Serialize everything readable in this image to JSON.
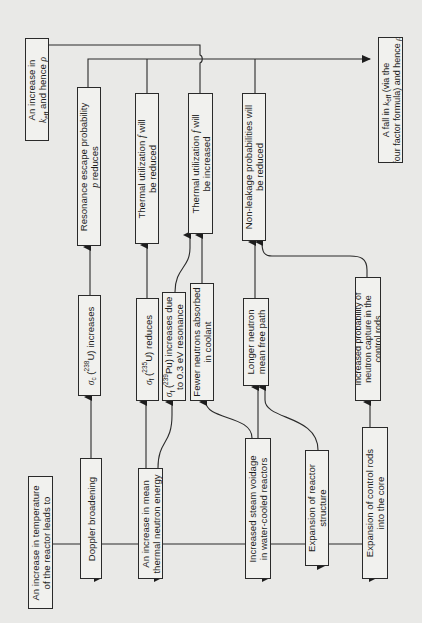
{
  "figure": {
    "orientation": "rotated-90-ccw",
    "line_color": "#2a2a2a",
    "box_fill": "#f1f1ee",
    "page_bg": "#e9e9e7"
  },
  "boxes": {
    "temperature_increase": {
      "lines": [
        "An increase in temperature",
        "of the reactor leads to"
      ]
    },
    "doppler": {
      "lines": [
        "Doppler broadening"
      ]
    },
    "thermal_energy": {
      "lines": [
        "An increase in mean",
        "thermal neutron energy"
      ]
    },
    "steam_voidage": {
      "lines": [
        "Increased steam voidage",
        "in water-cooled reactors"
      ]
    },
    "structure_expansion": {
      "lines": [
        "Expansion of reactor",
        "structure"
      ]
    },
    "control_rods_expansion": {
      "lines": [
        "Expansion of control rods",
        "into the core"
      ]
    },
    "sigma_c_u238": {
      "prefix": "σ",
      "prefix_sub": "c",
      "iso_sup": "238",
      "element": "U",
      "suffix": ") increases",
      "open": " ("
    },
    "sigma_f_u235": {
      "prefix": "σ",
      "prefix_sub": "f",
      "iso_sup": "235",
      "element": "U",
      "suffix": ") reduces",
      "open": " ("
    },
    "sigma_f_pu239": {
      "prefix": "σ",
      "prefix_sub": "f",
      "iso_sup": "239",
      "element": "Pu",
      "suffix": ") increases due",
      "open": " (",
      "line2": "to 0.3 eV resonance"
    },
    "fewer_absorbed": {
      "lines": [
        "Fewer neutrons absorbed",
        "in coolant"
      ]
    },
    "longer_mfp": {
      "lines": [
        "Longer neutron",
        "mean free path"
      ]
    },
    "control_rod_capture": {
      "lines": [
        "Increased probability of",
        "neutron capture in the",
        "control rods"
      ]
    },
    "resonance_escape": {
      "line1": "Resonance escape probability",
      "symbol": "p",
      "line2_rest": " reduces"
    },
    "thermal_util_reduced": {
      "line1_a": "Thermal utilization ",
      "symbol": "f",
      "line1_b": " will",
      "line2": "be reduced"
    },
    "thermal_util_increased": {
      "line1_a": "Thermal utilization ",
      "symbol": "f",
      "line1_b": " will",
      "line2": "be increased"
    },
    "non_leakage": {
      "lines": [
        "Non-leakage probabilities will",
        "be reduced"
      ]
    },
    "keff_increase": {
      "line1": "An increase in",
      "k": "k",
      "k_sub": "eff",
      "line2_rest": " and hence ",
      "rho": "ρ"
    },
    "keff_fall": {
      "line1_a": "A fall in ",
      "k": "k",
      "k_sub": "eff",
      "line1_b": " (via the",
      "line2_a": "four factor formula) and hence ",
      "rho": "ρ"
    }
  }
}
